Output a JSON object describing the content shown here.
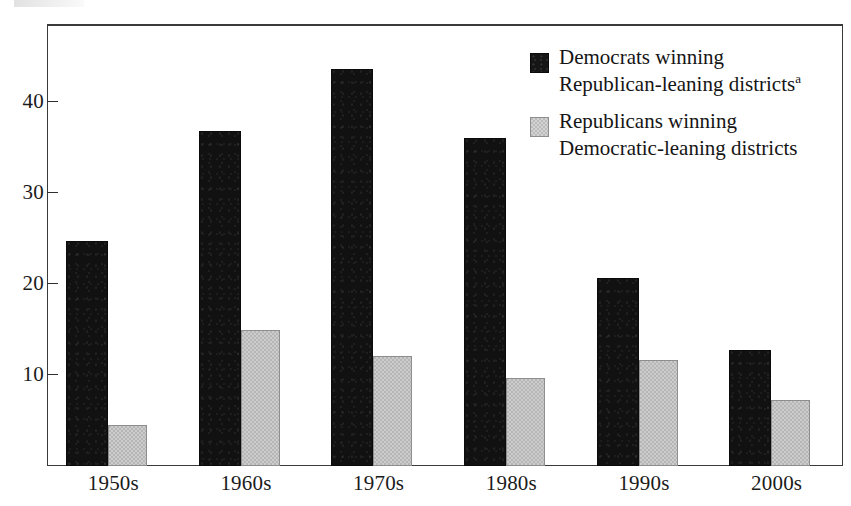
{
  "chart_data": {
    "type": "bar",
    "title": "",
    "subtitle": "",
    "xlabel": "",
    "ylabel": "",
    "categories": [
      "1950s",
      "1960s",
      "1970s",
      "1980s",
      "1990s",
      "2000s"
    ],
    "series": [
      {
        "name": "Democrats winning Republican-leaning districts",
        "color": "#111111",
        "values": [
          24.7,
          36.8,
          43.6,
          36.0,
          20.7,
          12.8
        ]
      },
      {
        "name": "Republicans winning Democratic-leaning districts",
        "color": "#b6b6b6",
        "values": [
          4.5,
          14.9,
          12.1,
          9.7,
          11.7,
          7.2
        ]
      }
    ],
    "ylim": [
      0,
      47.5
    ],
    "yticks": [
      10,
      20,
      30,
      40
    ],
    "ytick_labels": [
      "10",
      "20",
      "30",
      "40"
    ],
    "grid": false,
    "legend_position": "top-right",
    "frame": true
  },
  "axis": {
    "y_tick_labels": [
      "40",
      "30",
      "20",
      "10"
    ],
    "x_tick_labels": [
      "1950s",
      "1960s",
      "1970s",
      "1980s",
      "1990s",
      "2000s"
    ]
  },
  "legend": {
    "items": [
      {
        "swatch": "dark",
        "line1": "Democrats winning",
        "line2": "Republican-leaning districts",
        "footnote_marker": "a"
      },
      {
        "swatch": "gray",
        "line1": "Republicans winning",
        "line2": "Democratic-leaning districts",
        "footnote_marker": ""
      }
    ]
  }
}
